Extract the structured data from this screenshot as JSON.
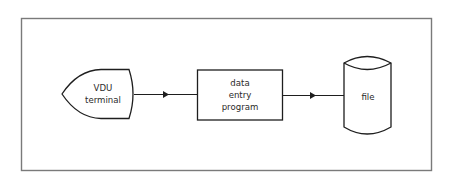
{
  "diagram": {
    "nodes": [
      {
        "id": "vdu",
        "shape": "display",
        "lines": [
          "VDU",
          "terminal"
        ]
      },
      {
        "id": "program",
        "shape": "process",
        "lines": [
          "data",
          "entry",
          "program"
        ]
      },
      {
        "id": "file",
        "shape": "stored-data",
        "lines": [
          "file"
        ]
      }
    ],
    "edges": [
      {
        "from": "vdu",
        "to": "program",
        "directed": true
      },
      {
        "from": "program",
        "to": "file",
        "directed": true
      }
    ],
    "colors": {
      "stroke": "#1e1e1e",
      "frame": "#7a7a7a",
      "background": "#ffffff"
    }
  }
}
